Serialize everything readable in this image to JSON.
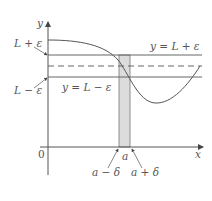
{
  "axes": {
    "y_label": "y",
    "x_label": "x",
    "origin_label": "0"
  },
  "labels": {
    "upper_left": "L + ε",
    "lower_left": "L − ε",
    "upper_line": "y = L + ε",
    "lower_line": "y = L − ε",
    "a": "a",
    "a_minus": "a − δ",
    "a_plus": "a + δ"
  },
  "colors": {
    "lines": "#555555",
    "band": "#dcdcdc"
  }
}
